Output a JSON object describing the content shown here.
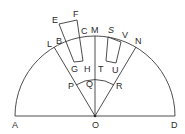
{
  "diagram": {
    "type": "geometry",
    "colors": {
      "stroke": "#3a3a3a",
      "text": "#2a2a2a",
      "background": "#ffffff"
    },
    "labels": {
      "A": "A",
      "B": "B",
      "C": "C",
      "D": "D",
      "E": "E",
      "F": "F",
      "G": "G",
      "H": "H",
      "L": "L",
      "M": "M",
      "N": "N",
      "O": "O",
      "P": "P",
      "Q": "Q",
      "R": "R",
      "S": "S",
      "T": "T",
      "U": "U",
      "V": "V"
    },
    "points": {
      "O": [
        95,
        116
      ],
      "A": [
        15,
        116
      ],
      "D": [
        175,
        116
      ],
      "M": [
        95,
        36
      ],
      "L": [
        54,
        47
      ],
      "N": [
        136,
        47
      ],
      "P": [
        76,
        84
      ],
      "Q": [
        95,
        80
      ],
      "R": [
        114,
        84
      ],
      "E": [
        59,
        24
      ],
      "F": [
        77,
        20
      ],
      "C": [
        80,
        37
      ],
      "H": [
        83,
        61
      ],
      "G": [
        74,
        62
      ],
      "B": [
        63,
        40
      ],
      "S": [
        108,
        37
      ],
      "V": [
        121,
        42
      ],
      "U": [
        116,
        63
      ],
      "T": [
        106,
        61
      ]
    },
    "radii": {
      "outer": 80,
      "inner": 36
    }
  }
}
